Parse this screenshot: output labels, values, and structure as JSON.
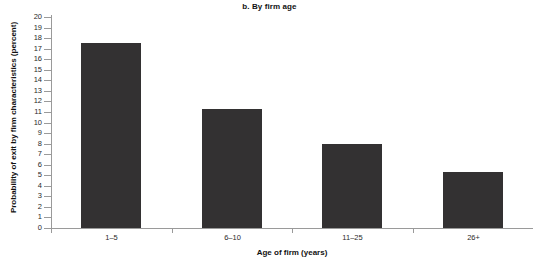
{
  "chart_data": {
    "type": "bar",
    "title": "b. By firm age",
    "xlabel": "Age of firm (years)",
    "ylabel": "Probability of exit by firm characteristics (percent)",
    "categories": [
      "1–5",
      "6–10",
      "11–25",
      "26+"
    ],
    "values": [
      17.5,
      11.3,
      8.0,
      5.3
    ],
    "ylim": [
      0,
      20
    ],
    "ytick_step": 1,
    "yticks": [
      0,
      1,
      2,
      3,
      4,
      5,
      6,
      7,
      8,
      9,
      10,
      11,
      12,
      13,
      14,
      15,
      16,
      17,
      18,
      19,
      20
    ],
    "ytick_labels": [
      "0",
      "1",
      "2",
      "3",
      "4",
      "5",
      "6",
      "7",
      "8",
      "9",
      "10",
      "11",
      "12",
      "13",
      "14",
      "15",
      "16",
      "17",
      "18",
      "19",
      "20"
    ],
    "grid": false,
    "legend": null,
    "bar_color": "#333132",
    "axis_color": "#9a9a9a"
  },
  "footer": {
    "source_note": ""
  }
}
